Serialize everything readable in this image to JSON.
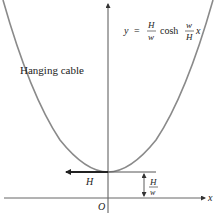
{
  "diagram": {
    "title": "Hanging cable",
    "curve_label": "Hanging cable",
    "equation": {
      "lhs": "y",
      "eq": "=",
      "frac1_num": "H",
      "frac1_den": "w",
      "func": "cosh",
      "frac2_num": "w",
      "frac2_den": "H",
      "var": "x"
    },
    "axes": {
      "x_label": "x",
      "origin_label": "O"
    },
    "force_label": "H",
    "dimension": {
      "num": "H",
      "den": "w"
    },
    "colors": {
      "curve": "#8a8a8a",
      "axis": "#555555",
      "arrow": "#222222",
      "text": "#222222"
    }
  }
}
